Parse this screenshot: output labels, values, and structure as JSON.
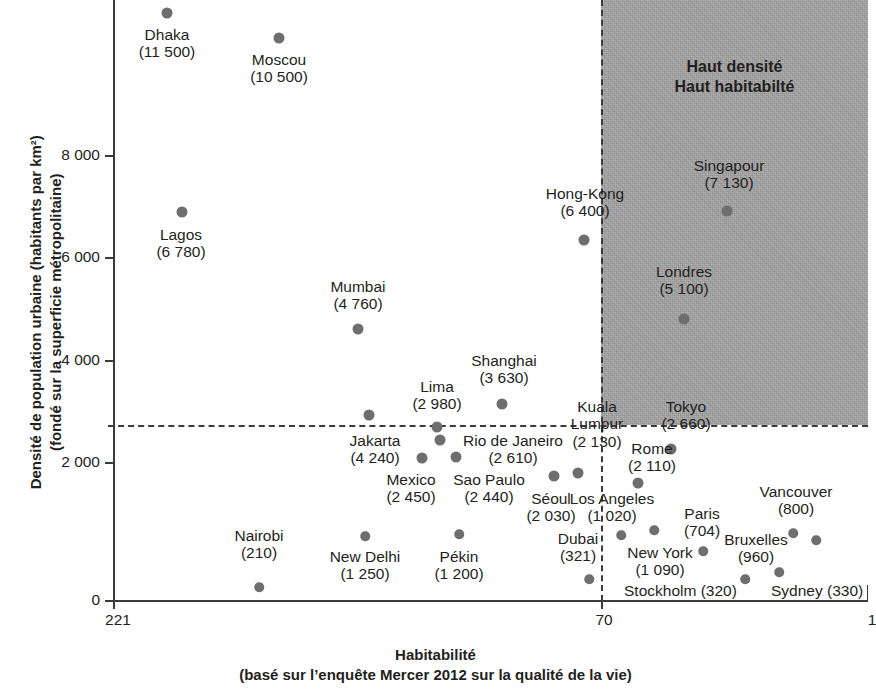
{
  "chart_data": {
    "type": "scatter",
    "title": "",
    "xlabel": "Habitabilité",
    "xlabel_sub": "(basé sur l’enquête Mercer 2012 sur la qualité de la vie)",
    "ylabel": "Densité de population urbaine (habitants par km²)",
    "ylabel_sub": "(fondé sur la superficie métropolitaine)",
    "xlim": [
      221,
      1
    ],
    "ylim": [
      0,
      12000
    ],
    "x_note": "Rang d’habitabilité — axe inversé (221 à gauche, 1 à droite)",
    "x_ticks": [
      "221",
      "70",
      "1"
    ],
    "y_ticks": [
      "0",
      "2 000",
      "4 000",
      "6 000",
      "8 000"
    ],
    "grid": false,
    "legend": false,
    "threshold_x": 70,
    "threshold_y": 3150,
    "region_label_line1": "Haut densité",
    "region_label_line2": "Haut habitabilté",
    "region_color": "#a6a6a6",
    "point_color": "#6e6e6e",
    "points": [
      {
        "city": "Dhaka",
        "value": "11 500",
        "density": 11500,
        "px": 167,
        "py": 13,
        "lx": 167,
        "ly": 26,
        "align": "center",
        "layout": "stack"
      },
      {
        "city": "Moscou",
        "value": "10 500",
        "density": 10500,
        "px": 279,
        "py": 38,
        "lx": 279,
        "ly": 51,
        "align": "center",
        "layout": "stack"
      },
      {
        "city": "Lagos",
        "value": "6 780",
        "density": 6780,
        "px": 182,
        "py": 212,
        "lx": 181,
        "ly": 226,
        "align": "center",
        "layout": "stack"
      },
      {
        "city": "Mumbai",
        "value": "4 760",
        "density": 4760,
        "px": 358,
        "py": 329,
        "lx": 358,
        "ly": 278,
        "align": "center",
        "layout": "stack"
      },
      {
        "city": "Hong-Kong",
        "value": "6 400",
        "density": 6400,
        "px": 584,
        "py": 240,
        "lx": 585,
        "ly": 185,
        "align": "center",
        "layout": "stack"
      },
      {
        "city": "Singapour",
        "value": "7 130",
        "density": 7130,
        "px": 727,
        "py": 211,
        "lx": 729,
        "ly": 157,
        "align": "center",
        "layout": "stack"
      },
      {
        "city": "Londres",
        "value": "5 100",
        "density": 5100,
        "px": 684,
        "py": 319,
        "lx": 684,
        "ly": 263,
        "align": "center",
        "layout": "stack"
      },
      {
        "city": "Shanghai",
        "value": "3 630",
        "density": 3630,
        "px": 502,
        "py": 404,
        "lx": 504,
        "ly": 352,
        "align": "center",
        "layout": "stack"
      },
      {
        "city": "Lima",
        "value": "2 980",
        "density": 2980,
        "px": 437,
        "py": 427,
        "lx": 437,
        "ly": 378,
        "align": "center",
        "layout": "stack"
      },
      {
        "city": "Jakarta",
        "value": "4 240",
        "density": 4240,
        "px": 369,
        "py": 415,
        "lx": 375,
        "ly": 432,
        "align": "center",
        "layout": "stack"
      },
      {
        "city": "Rio de Janeiro",
        "value": "2 610",
        "density": 2610,
        "px": 440,
        "py": 440,
        "lx": 513,
        "ly": 432,
        "align": "center",
        "layout": "stack"
      },
      {
        "city": "Mexico",
        "value": "2 450",
        "density": 2450,
        "px": 422,
        "py": 458,
        "lx": 411,
        "ly": 471,
        "align": "center",
        "layout": "stack"
      },
      {
        "city": "Sao Paulo",
        "value": "2 440",
        "density": 2440,
        "px": 456,
        "py": 457,
        "lx": 489,
        "ly": 471,
        "align": "center",
        "layout": "stack"
      },
      {
        "city": "Kuala Lumpur",
        "value": "2 130",
        "density": 2130,
        "px": 578,
        "py": 473,
        "lx": 597,
        "ly": 398,
        "align": "center",
        "layout": "stack2"
      },
      {
        "city": "Tokyo",
        "value": "2 660",
        "density": 2660,
        "px": 671,
        "py": 449,
        "lx": 686,
        "ly": 398,
        "align": "center",
        "layout": "stack"
      },
      {
        "city": "Rome",
        "value": "2 110",
        "density": 2110,
        "px": 638,
        "py": 483,
        "lx": 652,
        "ly": 440,
        "align": "center",
        "layout": "stack"
      },
      {
        "city": "Séoul",
        "value": "2 030",
        "density": 2030,
        "px": 554,
        "py": 476,
        "lx": 551,
        "ly": 490,
        "align": "center",
        "layout": "stack"
      },
      {
        "city": "Los Angeles",
        "value": "1 020",
        "density": 1020,
        "px": 654,
        "py": 530,
        "lx": 612,
        "ly": 490,
        "align": "center",
        "layout": "stack"
      },
      {
        "city": "Nairobi",
        "value": "210",
        "density": 210,
        "px": 259,
        "py": 587,
        "lx": 259,
        "ly": 527,
        "align": "center",
        "layout": "stack"
      },
      {
        "city": "New Delhi",
        "value": "1 250",
        "density": 1250,
        "px": 365,
        "py": 536,
        "lx": 365,
        "ly": 548,
        "align": "center",
        "layout": "stack"
      },
      {
        "city": "Pékin",
        "value": "1 200",
        "density": 1200,
        "px": 459,
        "py": 534,
        "lx": 459,
        "ly": 548,
        "align": "center",
        "layout": "stack"
      },
      {
        "city": "Dubai",
        "value": "321",
        "density": 321,
        "px": 589,
        "py": 579,
        "lx": 578,
        "ly": 530,
        "align": "center",
        "layout": "stack"
      },
      {
        "city": "New York",
        "value": "1 090",
        "density": 1090,
        "px": 621,
        "py": 535,
        "lx": 660,
        "ly": 544,
        "align": "center",
        "layout": "stack"
      },
      {
        "city": "Paris",
        "value": "704",
        "density": 704,
        "px": 703,
        "py": 551,
        "lx": 702,
        "ly": 505,
        "align": "center",
        "layout": "stack"
      },
      {
        "city": "Vancouver",
        "value": "800",
        "density": 800,
        "px": 793,
        "py": 533,
        "lx": 796,
        "ly": 483,
        "align": "center",
        "layout": "stack"
      },
      {
        "city": "Bruxelles",
        "value": "960",
        "density": 960,
        "px": 779,
        "py": 572,
        "lx": 756,
        "ly": 531,
        "align": "center",
        "layout": "stack"
      },
      {
        "city": "Stockholm",
        "value": "(320)",
        "density": 320,
        "px": 745,
        "py": 579,
        "lx": 624,
        "ly": 582,
        "align": "left",
        "layout": "inline"
      },
      {
        "city": "Sydney",
        "value": "(330)",
        "density": 330,
        "px": 816,
        "py": 540,
        "lx": 771,
        "ly": 582,
        "align": "left",
        "layout": "inline"
      }
    ]
  }
}
